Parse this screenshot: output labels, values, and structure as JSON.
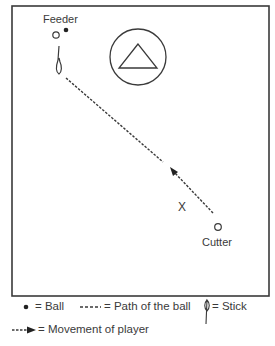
{
  "diagram": {
    "labels": {
      "feeder": "Feeder",
      "cutter": "Cutter",
      "defender": "X",
      "feeder_marker": "O",
      "cutter_marker": "O"
    },
    "elements": {
      "field": "rectangular playing area",
      "goal_crease": "circle with triangle goal",
      "ball_path": "dashed line from feeder stick toward center",
      "player_movement": "dashed arrow from cutter toward feeder"
    }
  },
  "legend": {
    "ball": "= Ball",
    "path_of_ball": "= Path of the ball",
    "stick": "= Stick",
    "movement": "= Movement of player"
  },
  "colors": {
    "line": "#3a3a3a",
    "background": "#ffffff"
  }
}
